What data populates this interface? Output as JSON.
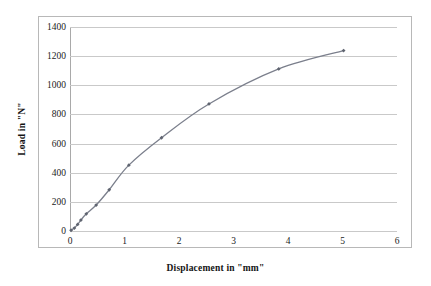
{
  "chart_data": {
    "type": "line",
    "title": "",
    "xlabel": "Displacement in \"mm\"",
    "ylabel": "Load in \"N\"",
    "xlim": [
      0,
      6
    ],
    "ylim": [
      0,
      1400
    ],
    "xticks": [
      0,
      1,
      2,
      3,
      4,
      5,
      6
    ],
    "xtick_labels": [
      "0",
      "1",
      "2",
      "3",
      "4",
      "5",
      "6"
    ],
    "yticks": [
      0,
      200,
      400,
      600,
      800,
      1000,
      1200,
      1400
    ],
    "ytick_labels": [
      "0",
      "200",
      "400",
      "600",
      "800",
      "1000",
      "1200",
      "1400"
    ],
    "grid": "horizontal",
    "legend": "none",
    "marker": "diamond",
    "line_color": "#7b7f8c",
    "marker_color": "#5f6470",
    "gridline_color": "#c9c9c9",
    "series": [
      {
        "name": "Load vs Displacement",
        "x": [
          0.02,
          0.08,
          0.14,
          0.2,
          0.3,
          0.48,
          0.72,
          1.08,
          1.68,
          2.55,
          3.83,
          5.02
        ],
        "y": [
          5,
          20,
          45,
          75,
          118,
          178,
          283,
          452,
          640,
          872,
          1112,
          1238
        ]
      }
    ]
  },
  "axis": {
    "x_title": "Displacement in \"mm\"",
    "y_title": "Load in \"N\""
  }
}
